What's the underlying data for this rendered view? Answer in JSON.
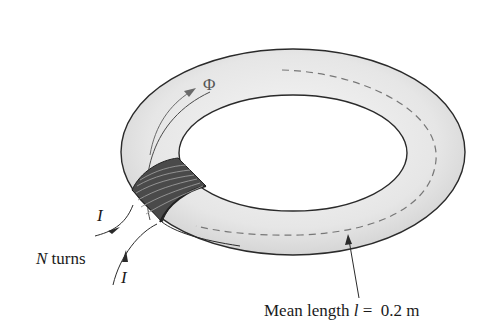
{
  "diagram": {
    "labels": {
      "flux": "Φ",
      "current_in": "I",
      "current_out": "I",
      "turns_var": "N",
      "turns_text": " turns",
      "mean_length_prefix": "Mean length ",
      "mean_length_var": "l",
      "mean_length_suffix": " =  0.2 m"
    },
    "values": {
      "mean_length_m": 0.2
    },
    "colors": {
      "outline": "#2a2a2a",
      "ring_fill": "#e2e2e2",
      "ring_highlight": "#f6f6f6",
      "dashed_path": "#777777",
      "coil": "#3a3a3a",
      "flux_arrow": "#6a6a6a"
    }
  }
}
